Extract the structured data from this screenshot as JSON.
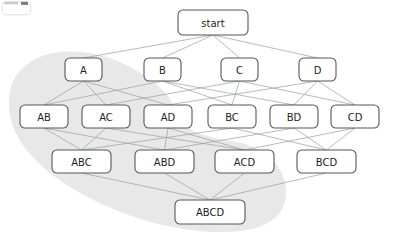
{
  "diagram": {
    "title": "start",
    "type": "subset-lattice-hasse-diagram",
    "colors": {
      "node_fill": "#ffffff",
      "node_stroke": "#55575a",
      "edge_stroke": "#9a9c9f",
      "region_fill": "#e8e8e8",
      "label_color": "#1d1d1d",
      "background": "#ffffff"
    },
    "levels": [
      {
        "name": "root",
        "labels": [
          "start"
        ]
      },
      {
        "name": "singletons",
        "labels": [
          "A",
          "B",
          "C",
          "D"
        ]
      },
      {
        "name": "pairs",
        "labels": [
          "AB",
          "AC",
          "AD",
          "BC",
          "BD",
          "CD"
        ]
      },
      {
        "name": "triples",
        "labels": [
          "ABC",
          "ABD",
          "ACD",
          "BCD"
        ]
      },
      {
        "name": "full",
        "labels": [
          "ABCD"
        ]
      }
    ],
    "nodes": [
      {
        "id": "start",
        "label": "start",
        "x": 178,
        "y": 10,
        "w": 70,
        "h": 25
      },
      {
        "id": "A",
        "label": "A",
        "x": 65,
        "y": 58,
        "w": 37,
        "h": 23
      },
      {
        "id": "B",
        "label": "B",
        "x": 144,
        "y": 58,
        "w": 37,
        "h": 23
      },
      {
        "id": "C",
        "label": "C",
        "x": 221,
        "y": 58,
        "w": 37,
        "h": 23
      },
      {
        "id": "D",
        "label": "D",
        "x": 299,
        "y": 58,
        "w": 37,
        "h": 23
      },
      {
        "id": "AB",
        "label": "AB",
        "x": 20,
        "y": 105,
        "w": 48,
        "h": 23
      },
      {
        "id": "AC",
        "label": "AC",
        "x": 82,
        "y": 105,
        "w": 48,
        "h": 23
      },
      {
        "id": "AD",
        "label": "AD",
        "x": 144,
        "y": 105,
        "w": 48,
        "h": 23
      },
      {
        "id": "BC",
        "label": "BC",
        "x": 208,
        "y": 105,
        "w": 48,
        "h": 23
      },
      {
        "id": "BD",
        "label": "BD",
        "x": 270,
        "y": 105,
        "w": 48,
        "h": 23
      },
      {
        "id": "CD",
        "label": "CD",
        "x": 331,
        "y": 105,
        "w": 48,
        "h": 23
      },
      {
        "id": "ABC",
        "label": "ABC",
        "x": 52,
        "y": 150,
        "w": 59,
        "h": 23
      },
      {
        "id": "ABD",
        "label": "ABD",
        "x": 135,
        "y": 150,
        "w": 59,
        "h": 23
      },
      {
        "id": "ACD",
        "label": "ACD",
        "x": 215,
        "y": 150,
        "w": 59,
        "h": 23
      },
      {
        "id": "BCD",
        "label": "BCD",
        "x": 297,
        "y": 150,
        "w": 59,
        "h": 23
      },
      {
        "id": "ABCD",
        "label": "ABCD",
        "x": 175,
        "y": 200,
        "w": 70,
        "h": 24
      }
    ],
    "edges": [
      {
        "from": "start",
        "to": "A"
      },
      {
        "from": "start",
        "to": "B"
      },
      {
        "from": "start",
        "to": "C"
      },
      {
        "from": "start",
        "to": "D"
      },
      {
        "from": "A",
        "to": "AB"
      },
      {
        "from": "A",
        "to": "AC"
      },
      {
        "from": "A",
        "to": "AD"
      },
      {
        "from": "B",
        "to": "AB"
      },
      {
        "from": "B",
        "to": "BC"
      },
      {
        "from": "B",
        "to": "BD"
      },
      {
        "from": "C",
        "to": "AC"
      },
      {
        "from": "C",
        "to": "BC"
      },
      {
        "from": "C",
        "to": "CD"
      },
      {
        "from": "D",
        "to": "AD"
      },
      {
        "from": "D",
        "to": "BD"
      },
      {
        "from": "D",
        "to": "CD"
      },
      {
        "from": "AB",
        "to": "ABC"
      },
      {
        "from": "AB",
        "to": "ABD"
      },
      {
        "from": "AC",
        "to": "ABC"
      },
      {
        "from": "AC",
        "to": "ACD"
      },
      {
        "from": "AD",
        "to": "ABD"
      },
      {
        "from": "AD",
        "to": "ACD"
      },
      {
        "from": "BC",
        "to": "ABC"
      },
      {
        "from": "BC",
        "to": "BCD"
      },
      {
        "from": "BD",
        "to": "ABD"
      },
      {
        "from": "BD",
        "to": "BCD"
      },
      {
        "from": "CD",
        "to": "ACD"
      },
      {
        "from": "CD",
        "to": "BCD"
      },
      {
        "from": "ABC",
        "to": "ABCD"
      },
      {
        "from": "ABD",
        "to": "ABCD"
      },
      {
        "from": "ACD",
        "to": "ABCD"
      },
      {
        "from": "BCD",
        "to": "ABCD"
      }
    ],
    "highlight_region": {
      "name": "shaded-subset-region",
      "path": "M 62,52 C 36,54 14,68 10,92 C 6,114 14,136 30,154 C 52,180 96,206 150,222 C 196,234 242,236 266,224 C 286,214 290,194 283,176 C 276,158 258,146 236,142 C 212,138 196,134 186,126 C 176,118 176,106 168,96 C 158,84 144,74 128,66 C 110,56 84,50 62,52 Z"
    }
  }
}
